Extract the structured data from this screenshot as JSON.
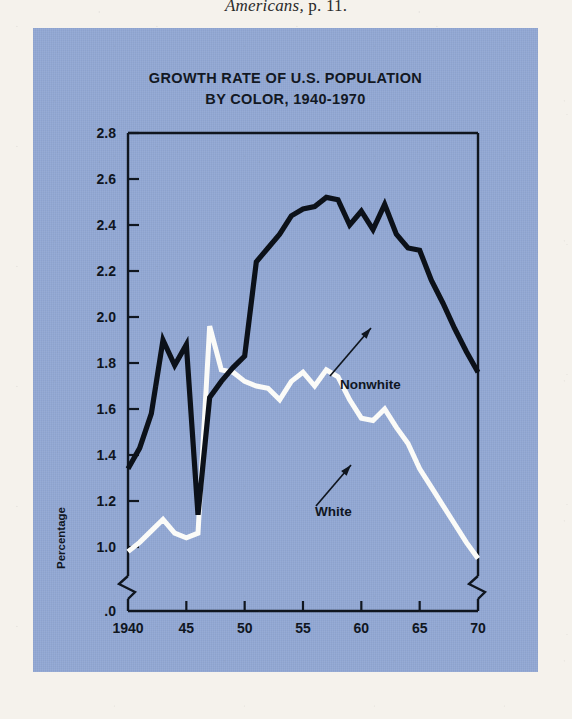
{
  "page": {
    "caption_italic": "Americans,",
    "caption_rest": " p. 11."
  },
  "figure": {
    "panel_color": "#92a8d4",
    "title_line1": "GROWTH RATE OF U.S. POPULATION",
    "title_line2": "BY COLOR, 1940-1970"
  },
  "chart_data": {
    "type": "line",
    "title": "GROWTH RATE OF U.S. POPULATION BY COLOR, 1940-1970",
    "xlabel": "",
    "ylabel": "Percentage",
    "xlim": [
      1940,
      1970
    ],
    "ylim": [
      0.9,
      2.8
    ],
    "y_axis_break": true,
    "y_break_label": ".0",
    "x_axis_break_right": true,
    "grid": false,
    "legend_position": "inline-annotations",
    "yticks": [
      "2.8",
      "2.6",
      "2.4",
      "2.2",
      "2.0",
      "1.8",
      "1.6",
      "1.4",
      "1.2",
      "1.0",
      ".0"
    ],
    "ytick_values": [
      2.8,
      2.6,
      2.4,
      2.2,
      2.0,
      1.8,
      1.6,
      1.4,
      1.2,
      1.0,
      0.0
    ],
    "xticks": [
      "1940",
      "45",
      "50",
      "55",
      "60",
      "65",
      "70"
    ],
    "xtick_values": [
      1940,
      1945,
      1950,
      1955,
      1960,
      1965,
      1970
    ],
    "x": [
      1940,
      1941,
      1942,
      1943,
      1944,
      1945,
      1946,
      1947,
      1948,
      1949,
      1950,
      1951,
      1952,
      1953,
      1954,
      1955,
      1956,
      1957,
      1958,
      1959,
      1960,
      1961,
      1962,
      1963,
      1964,
      1965,
      1966,
      1967,
      1968,
      1969,
      1970
    ],
    "series": [
      {
        "name": "Nonwhite",
        "color": "#0c1119",
        "values": [
          1.34,
          1.43,
          1.58,
          1.9,
          1.79,
          1.88,
          1.14,
          1.65,
          1.72,
          1.78,
          1.83,
          2.24,
          2.3,
          2.36,
          2.44,
          2.47,
          2.48,
          2.52,
          2.51,
          2.4,
          2.46,
          2.38,
          2.49,
          2.36,
          2.3,
          2.29,
          2.16,
          2.06,
          1.95,
          1.85,
          1.76
        ]
      },
      {
        "name": "White",
        "color": "#fbfbf8",
        "values": [
          0.98,
          1.02,
          1.07,
          1.12,
          1.06,
          1.04,
          1.06,
          1.96,
          1.77,
          1.76,
          1.72,
          1.7,
          1.69,
          1.64,
          1.72,
          1.76,
          1.7,
          1.77,
          1.74,
          1.64,
          1.56,
          1.55,
          1.6,
          1.52,
          1.45,
          1.34,
          1.26,
          1.18,
          1.1,
          1.02,
          0.95
        ]
      }
    ],
    "annotations": [
      {
        "text": "Nonwhite",
        "points_to_series": "Nonwhite"
      },
      {
        "text": "White",
        "points_to_series": "White"
      }
    ]
  }
}
